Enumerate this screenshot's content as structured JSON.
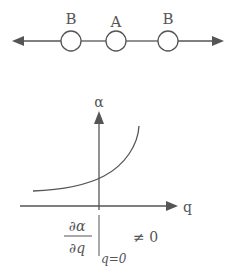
{
  "top_diagram": {
    "labels": [
      "B",
      "A",
      "B"
    ],
    "description": "chain of three particles B-A-B on a line with outward arrows"
  },
  "graph": {
    "y_axis_label": "α",
    "x_axis_label": "q",
    "curve": "monotonic increasing, concave up"
  },
  "equation": {
    "numerator": "∂α",
    "denominator": "∂q",
    "evaluated_at": "q=0",
    "relation": "≠ 0"
  },
  "colors": {
    "stroke": "#555555",
    "background": "#ffffff"
  }
}
